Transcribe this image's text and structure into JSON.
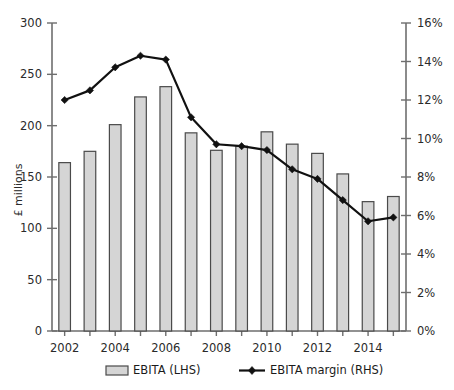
{
  "chart_data": {
    "type": "bar",
    "title": "",
    "subtitle": "",
    "xlabel": "",
    "ylabel": "£ millions",
    "y2label": "",
    "categories": [
      "2002",
      "2003",
      "2004",
      "2005",
      "2006",
      "2007",
      "2008",
      "2009",
      "2010",
      "2011",
      "2012",
      "2013",
      "2014",
      "2015"
    ],
    "x_tick_labels": [
      "2002",
      "",
      "2004",
      "",
      "2006",
      "",
      "2008",
      "",
      "2010",
      "",
      "2012",
      "",
      "2014",
      ""
    ],
    "ylim": [
      0,
      300
    ],
    "y_ticks": [
      0,
      50,
      100,
      150,
      200,
      250,
      300
    ],
    "y_tick_labels": [
      "0",
      "50",
      "100",
      "150",
      "200",
      "250",
      "300"
    ],
    "y2lim": [
      0,
      16
    ],
    "y2_ticks": [
      0,
      2,
      4,
      6,
      8,
      10,
      12,
      14,
      16
    ],
    "y2_tick_labels": [
      "0%",
      "2%",
      "4%",
      "6%",
      "8%",
      "10%",
      "12%",
      "14%",
      "16%"
    ],
    "grid": false,
    "legend_position": "bottom",
    "series": [
      {
        "name": "EBITA (LHS)",
        "type": "bar",
        "axis": "left",
        "unit": "£ millions",
        "color": "#d5d5d5",
        "edge_color": "#4a4a4a",
        "values": [
          164,
          175,
          201,
          228,
          238,
          193,
          176,
          180,
          194,
          182,
          173,
          153,
          126,
          131
        ]
      },
      {
        "name": "EBITA margin (RHS)",
        "type": "line",
        "axis": "right",
        "unit": "%",
        "color": "#111111",
        "marker": "diamond",
        "values": [
          12.0,
          12.5,
          13.7,
          14.3,
          14.1,
          11.1,
          9.7,
          9.6,
          9.4,
          8.4,
          7.9,
          6.8,
          5.7,
          5.9
        ]
      }
    ]
  },
  "axes": {
    "left_axis_title": "£ millions"
  },
  "legend": {
    "items": [
      {
        "label": "EBITA (LHS)",
        "kind": "bar-swatch"
      },
      {
        "label": "EBITA margin (RHS)",
        "kind": "line-marker"
      }
    ]
  }
}
